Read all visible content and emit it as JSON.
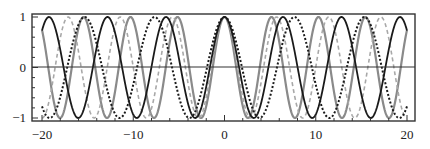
{
  "chart_data": {
    "type": "line",
    "title": "",
    "xlabel": "",
    "ylabel": "",
    "xlim": [
      -20,
      20
    ],
    "ylim": [
      -1,
      1
    ],
    "grid": false,
    "legend": "none",
    "x_ticks": [
      -20,
      -10,
      0,
      10,
      20
    ],
    "x_tick_labels": [
      "−20",
      "−10",
      "0",
      "10",
      "20"
    ],
    "y_ticks": [
      -1,
      0,
      1
    ],
    "y_tick_labels": [
      "−1",
      "0",
      "1"
    ],
    "zero_line": true,
    "series": [
      {
        "name": "gray-solid",
        "formula": "cos(1.22 x)",
        "omega": 1.22,
        "color": "#8a8a8a",
        "style": "solid",
        "width": 2.2
      },
      {
        "name": "gray-dashed",
        "formula": "cos(1.10 x)",
        "omega": 1.1,
        "color": "#a8a8a8",
        "style": "dashed",
        "width": 1.6
      },
      {
        "name": "black-dotted",
        "formula": "cos(0.82 x)",
        "omega": 0.82,
        "color": "#1a1a1a",
        "style": "dotted",
        "width": 2.0
      },
      {
        "name": "black-solid",
        "formula": "cos(0.98 x)",
        "omega": 0.98,
        "color": "#1a1a1a",
        "style": "solid",
        "width": 1.8
      }
    ]
  }
}
